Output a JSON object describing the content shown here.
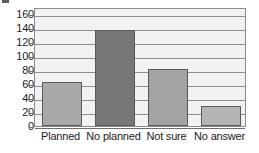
{
  "chart_data": {
    "type": "bar",
    "title": "",
    "subtitle": "",
    "xlabel": "",
    "ylabel": "",
    "categories": [
      "Planned",
      "No planned",
      "Not sure",
      "No answer"
    ],
    "values": [
      63,
      137,
      81,
      28
    ],
    "series": [
      {
        "name": "",
        "values": [
          63,
          137,
          81,
          28
        ]
      }
    ],
    "bar_colors": [
      "#a9a9a9",
      "#777777",
      "#a3a3a3",
      "#b4b4b4"
    ],
    "bar_border_color": "#5a5a5a",
    "ylim": [
      0,
      170
    ],
    "yticks": [
      0,
      20,
      40,
      60,
      80,
      100,
      120,
      140,
      160
    ],
    "ytick_labels": [
      "0",
      "20",
      "40",
      "60",
      "80",
      "100",
      "120",
      "140",
      "160"
    ],
    "grid": "horizontal",
    "legend": "none",
    "legend_entries": [],
    "annotations": [],
    "plot_background": "#f2f2f2",
    "frame_color": "#8a8a8a"
  },
  "axes": {
    "y": {
      "ticks": [
        "0",
        "20",
        "40",
        "60",
        "80",
        "100",
        "120",
        "140",
        "160"
      ]
    },
    "x": {
      "ticks": [
        "Planned",
        "No planned",
        "Not sure",
        "No answer"
      ]
    }
  }
}
